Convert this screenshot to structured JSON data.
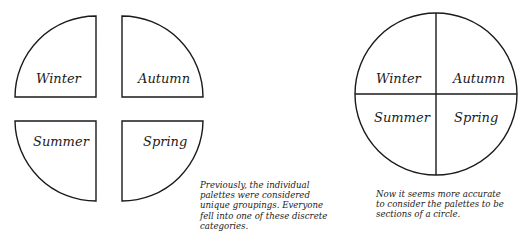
{
  "left_diagram": {
    "description": "Four separated quarter-circle segments",
    "segments": [
      {
        "id": "winter",
        "label": "Winter",
        "position": "top-left"
      },
      {
        "id": "autumn",
        "label": "Autumn",
        "position": "top-right"
      },
      {
        "id": "summer",
        "label": "Summer",
        "position": "bottom-left"
      },
      {
        "id": "spring",
        "label": "Spring",
        "position": "bottom-right"
      }
    ],
    "caption_lines": [
      "Previously, the individual",
      "palettes were considered",
      "unique groupings. Everyone",
      "fell into one of these discrete",
      "categories."
    ]
  },
  "right_diagram": {
    "description": "Single circle divided into four sections",
    "segments": [
      {
        "id": "winter",
        "label": "Winter",
        "position": "top-left"
      },
      {
        "id": "autumn",
        "label": "Autumn",
        "position": "top-right"
      },
      {
        "id": "summer",
        "label": "Summer",
        "position": "bottom-left"
      },
      {
        "id": "spring",
        "label": "Spring",
        "position": "bottom-right"
      }
    ],
    "caption_lines": [
      "Now it seems more accurate",
      "to consider the palettes to be",
      "sections of a circle."
    ]
  },
  "colors": {
    "ink": "#1a1a1a",
    "background": "#ffffff"
  }
}
